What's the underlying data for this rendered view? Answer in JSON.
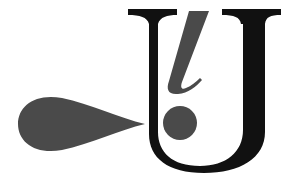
{
  "logo": {
    "letter": "U",
    "inner_glyph": "l",
    "mark": "!",
    "colors": {
      "letter": "#111111",
      "accent": "#4a4a4a",
      "background": "#ffffff"
    }
  }
}
